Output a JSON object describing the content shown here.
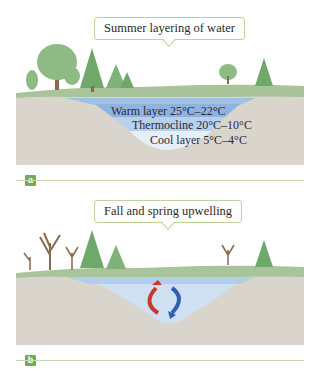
{
  "panel_a": {
    "tag": "a",
    "callout": "Summer layering of water",
    "layers": [
      {
        "label": "Warm layer 25°C–22°C",
        "color": "#8fb3e0"
      },
      {
        "label": "Thermocline 20°C–10°C",
        "color": "#b7d0ee"
      },
      {
        "label": "Cool layer 5°C–4°C",
        "color": "#e6eef8"
      }
    ]
  },
  "panel_b": {
    "tag": "b",
    "callout": "Fall and spring upwelling",
    "arrows": {
      "warm_color": "#c8382c",
      "cool_color": "#2f5fb0"
    }
  },
  "colors": {
    "ground": "#d9d5cc",
    "grass": "#a9c49a",
    "tree": "#6ea86a",
    "trunk": "#8a6a4a",
    "accent": "#6fb04a"
  }
}
